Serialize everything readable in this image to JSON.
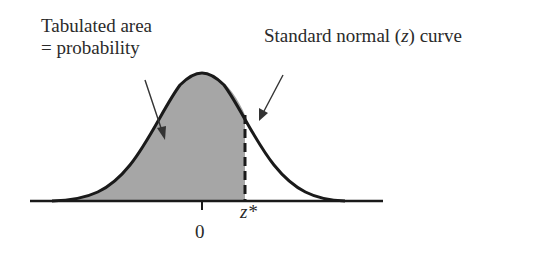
{
  "diagram": {
    "type": "standard-normal-curve",
    "annotations": {
      "shaded_area_label_line1": "Tabulated area",
      "shaded_area_label_line2": "= probability",
      "curve_label_prefix": "Standard normal (",
      "curve_label_var": "z",
      "curve_label_suffix": ") curve"
    },
    "axis": {
      "center_tick_label": "0",
      "critical_value_label": "z*"
    },
    "colors": {
      "shaded_fill": "#a6a6a6",
      "curve_stroke": "#1a1a1a",
      "text": "#2a2a2a",
      "background": "#ffffff"
    }
  }
}
